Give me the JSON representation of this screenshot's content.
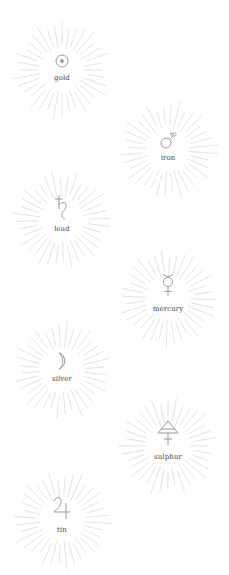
{
  "theme": {
    "background": "#ffffff",
    "ray_color": "#e4e4e4",
    "symbol_color": "#9a9a9a",
    "label_color": "#444444"
  },
  "elements": [
    {
      "label": "gold",
      "symbol": "sun-circle-dot-icon",
      "x": 62,
      "y": 70
    },
    {
      "label": "iron",
      "symbol": "mars-icon",
      "x": 168,
      "y": 150
    },
    {
      "label": "lead",
      "symbol": "saturn-icon",
      "x": 62,
      "y": 220
    },
    {
      "label": "mercury",
      "symbol": "mercury-icon",
      "x": 168,
      "y": 298
    },
    {
      "label": "silver",
      "symbol": "moon-crescent-icon",
      "x": 62,
      "y": 370
    },
    {
      "label": "sulphur",
      "symbol": "sulphur-triangle-cross-icon",
      "x": 168,
      "y": 446
    },
    {
      "label": "tin",
      "symbol": "jupiter-icon",
      "x": 62,
      "y": 520
    }
  ]
}
